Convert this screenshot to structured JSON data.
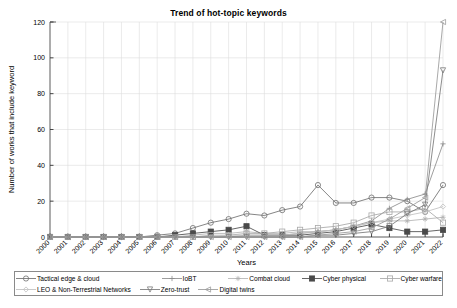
{
  "chart_data": {
    "type": "line",
    "title": "Trend of hot-topic keywords",
    "xlabel": "Years",
    "ylabel": "Number of works that include keyword",
    "grid": true,
    "legend_position": "bottom",
    "xlim": [
      2000,
      2022
    ],
    "ylim": [
      0,
      120
    ],
    "yticks": [
      0,
      20,
      40,
      60,
      80,
      100,
      120
    ],
    "categories": [
      "2000",
      "2001",
      "2002",
      "2003",
      "2004",
      "2005",
      "2006",
      "2007",
      "2008",
      "2009",
      "2010",
      "2011",
      "2012",
      "2013",
      "2014",
      "2015",
      "2016",
      "2017",
      "2018",
      "2019",
      "2020",
      "2021",
      "2022"
    ],
    "series": [
      {
        "name": "Tactical edge & cloud",
        "marker": "circle",
        "color": "#6f6f6f",
        "values": [
          0,
          0,
          0,
          0,
          0,
          0,
          1,
          2,
          5,
          8,
          10,
          13,
          12,
          15,
          17,
          29,
          19,
          19,
          22,
          22,
          20,
          14,
          29
        ]
      },
      {
        "name": "IoBT",
        "marker": "plus",
        "color": "#8c8c8c",
        "values": [
          0,
          0,
          0,
          0,
          0,
          0,
          0,
          0,
          0,
          0,
          0,
          1,
          1,
          1,
          2,
          3,
          4,
          6,
          9,
          16,
          21,
          24,
          52
        ]
      },
      {
        "name": "Combat cloud",
        "marker": "star",
        "color": "#b3b3b3",
        "values": [
          0,
          0,
          0,
          0,
          0,
          0,
          0,
          0,
          1,
          2,
          2,
          3,
          2,
          2,
          3,
          3,
          4,
          6,
          8,
          9,
          9,
          10,
          11
        ]
      },
      {
        "name": "Cyber physical",
        "marker": "square-filled",
        "color": "#4a4a4a",
        "values": [
          0,
          0,
          0,
          0,
          0,
          0,
          0,
          1,
          2,
          3,
          4,
          6,
          1,
          1,
          1,
          2,
          3,
          5,
          7,
          5,
          3,
          3,
          4
        ]
      },
      {
        "name": "Cyber warfare",
        "marker": "square-open",
        "color": "#a8a8a8",
        "values": [
          0,
          0,
          0,
          0,
          0,
          0,
          0,
          0,
          0,
          1,
          1,
          2,
          2,
          3,
          4,
          5,
          6,
          8,
          12,
          14,
          14,
          16,
          8
        ]
      },
      {
        "name": "LEO & Non-Terrestrial Networks",
        "marker": "diamond",
        "color": "#c0c0c0",
        "values": [
          0,
          0,
          0,
          0,
          0,
          0,
          0,
          0,
          0,
          0,
          1,
          1,
          1,
          1,
          2,
          3,
          4,
          6,
          8,
          10,
          12,
          14,
          17
        ]
      },
      {
        "name": "Zero-trust",
        "marker": "triangle-down",
        "color": "#787878",
        "values": [
          0,
          0,
          0,
          0,
          0,
          0,
          0,
          0,
          0,
          0,
          0,
          0,
          0,
          0,
          0,
          1,
          1,
          2,
          3,
          6,
          13,
          18,
          93
        ]
      },
      {
        "name": "Digital twins",
        "marker": "triangle-left",
        "color": "#9a9a9a",
        "values": [
          0,
          0,
          0,
          0,
          0,
          0,
          0,
          0,
          0,
          0,
          0,
          0,
          0,
          0,
          0,
          1,
          2,
          3,
          5,
          10,
          16,
          22,
          120
        ]
      }
    ]
  },
  "legend": {
    "row1": [
      {
        "label": "Tactical edge & cloud",
        "marker": "circle"
      },
      {
        "label": "IoBT",
        "marker": "plus"
      },
      {
        "label": "Combat cloud",
        "marker": "star"
      },
      {
        "label": "Cyber physical",
        "marker": "square-filled"
      },
      {
        "label": "Cyber warfare",
        "marker": "square-open"
      }
    ],
    "row2": [
      {
        "label": "LEO & Non-Terrestrial Networks",
        "marker": "diamond"
      },
      {
        "label": "Zero-trust",
        "marker": "triangle-down"
      },
      {
        "label": "Digital twins",
        "marker": "triangle-left"
      }
    ]
  }
}
